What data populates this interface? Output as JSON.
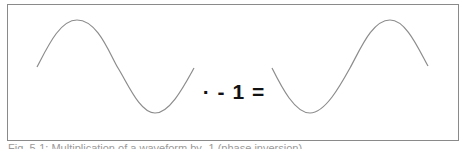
{
  "figure": {
    "equation_text": "· - 1 =",
    "caption": "Fig. 5-1: Multiplication of a waveform by -1 (phase inversion)",
    "waves": [
      {
        "name": "original-sine",
        "description": "one period sine starting mid, peak then trough"
      },
      {
        "name": "inverted-sine",
        "description": "one period sine starting mid, trough then peak"
      }
    ],
    "colors": {
      "border": "#8a8a8a",
      "wave": "#8c8c8c",
      "text": "#111111"
    }
  }
}
